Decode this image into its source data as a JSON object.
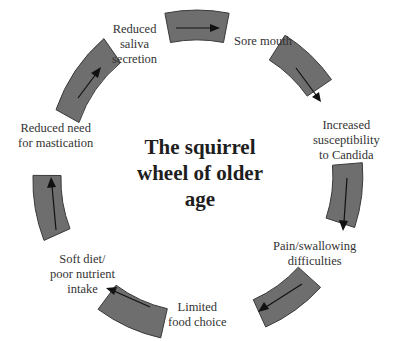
{
  "diagram": {
    "title_lines": [
      "The squirrel",
      "wheel of older",
      "age"
    ],
    "colors": {
      "segment_fill": "#6e6e6e",
      "segment_stroke": "#3a3a3a",
      "arrow": "#111111",
      "text": "#333333"
    },
    "cycle_direction": "clockwise",
    "nodes": [
      {
        "id": "sore-mouth",
        "lines": [
          "Sore mouth"
        ]
      },
      {
        "id": "candida",
        "lines": [
          "Increased",
          "susceptibility",
          "to Candida"
        ]
      },
      {
        "id": "pain-swallowing",
        "lines": [
          "Pain/swallowing",
          "difficulties"
        ]
      },
      {
        "id": "limited-food",
        "lines": [
          "Limited",
          "food choice"
        ]
      },
      {
        "id": "soft-diet",
        "lines": [
          "Soft diet/",
          "poor nutrient",
          "intake"
        ]
      },
      {
        "id": "reduced-mastication",
        "lines": [
          "Reduced need",
          "for mastication"
        ]
      },
      {
        "id": "reduced-saliva",
        "lines": [
          "Reduced",
          "saliva",
          "secretion"
        ]
      }
    ]
  }
}
